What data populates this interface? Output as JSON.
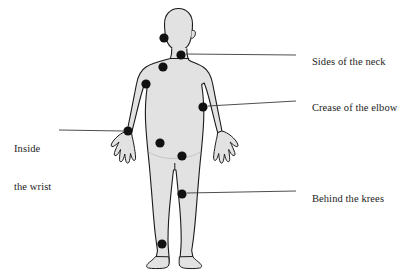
{
  "figure": {
    "type": "annotated-illustration",
    "canvas": {
      "width": 401,
      "height": 279
    },
    "colors": {
      "background": "#ffffff",
      "body_fill": "#e2e2e2",
      "body_outline": "#1a1a1a",
      "marker_fill": "#111111",
      "leader_line": "#3a3a3a",
      "text": "#1c1c1c"
    }
  },
  "labels": [
    {
      "id": "sides-of-the-neck",
      "text": "Sides of the neck",
      "lines": [
        "Sides of the neck"
      ],
      "side": "right",
      "text_x": 301,
      "text_y": 49,
      "marker": {
        "x": 181,
        "y": 55,
        "r": 4.6
      },
      "leader": {
        "x1": 186,
        "y1": 54,
        "x2": 296,
        "y2": 55
      }
    },
    {
      "id": "crease-of-the-elbow",
      "text": "Crease of the elbow",
      "lines": [
        "Crease of the elbow"
      ],
      "side": "right",
      "text_x": 301,
      "text_y": 95,
      "marker": {
        "x": 203,
        "y": 107,
        "r": 4.6
      },
      "leader": {
        "x1": 208,
        "y1": 106,
        "x2": 296,
        "y2": 101
      }
    },
    {
      "id": "behind-the-knees",
      "text": "Behind the krees",
      "lines": [
        "Behind the krees"
      ],
      "side": "right",
      "text_x": 301,
      "text_y": 186,
      "marker": {
        "x": 182,
        "y": 194,
        "r": 4.6
      },
      "leader": {
        "x1": 187,
        "y1": 193,
        "x2": 296,
        "y2": 191
      }
    },
    {
      "id": "inside-the-wrist",
      "text": "Inside the wrist",
      "lines": [
        "Inside",
        "the wrist"
      ],
      "side": "left",
      "text_x": 14,
      "text_y": 124,
      "marker": {
        "x": 128,
        "y": 131,
        "r": 4.6
      },
      "leader": {
        "x1": 123,
        "y1": 131,
        "x2": 59,
        "y2": 130
      }
    }
  ],
  "unlabeled_markers": [
    {
      "id": "marker-side-of-head",
      "x": 164,
      "y": 38,
      "r": 4.6
    },
    {
      "id": "marker-shoulder",
      "x": 163,
      "y": 67,
      "r": 4.6
    },
    {
      "id": "marker-upper-arm",
      "x": 146,
      "y": 84,
      "r": 4.6
    },
    {
      "id": "marker-abdomen",
      "x": 160,
      "y": 143,
      "r": 4.6
    },
    {
      "id": "marker-hip",
      "x": 182,
      "y": 156,
      "r": 4.6
    },
    {
      "id": "marker-ankle",
      "x": 162,
      "y": 244,
      "r": 4.6
    }
  ]
}
